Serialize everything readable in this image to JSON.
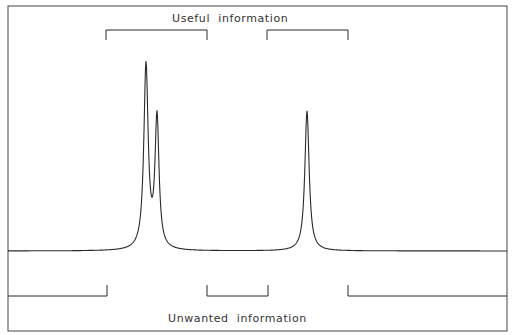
{
  "diagram": {
    "type": "spectrum-annotation",
    "top_label": "Useful  information",
    "bottom_label": "Unwanted  information",
    "frame": {
      "left": 8,
      "top": 6,
      "right": 507,
      "bottom": 331
    },
    "baseline_y": 250,
    "peaks": [
      {
        "name": "peak-1",
        "x": 146,
        "y": 66
      },
      {
        "name": "peak-2",
        "x": 157,
        "y": 119
      },
      {
        "name": "peak-3",
        "x": 307,
        "y": 110
      }
    ],
    "useful_brackets": [
      {
        "x1": 106,
        "x2": 207,
        "y": 30,
        "tick_down_to": 40
      },
      {
        "x1": 267,
        "x2": 348,
        "y": 30,
        "tick_down_to": 40
      }
    ],
    "unwanted_brackets": [
      {
        "x1": 8,
        "x2": 107,
        "y": 296,
        "tick_up_to": 285,
        "left_open": true
      },
      {
        "x1": 207,
        "x2": 268,
        "y": 296,
        "tick_up_to": 285
      },
      {
        "x1": 348,
        "x2": 507,
        "y": 296,
        "tick_up_to": 285,
        "right_open": true
      }
    ],
    "colors": {
      "line": "#2a2a2a",
      "frame": "#444444",
      "background": "#ffffff"
    }
  }
}
